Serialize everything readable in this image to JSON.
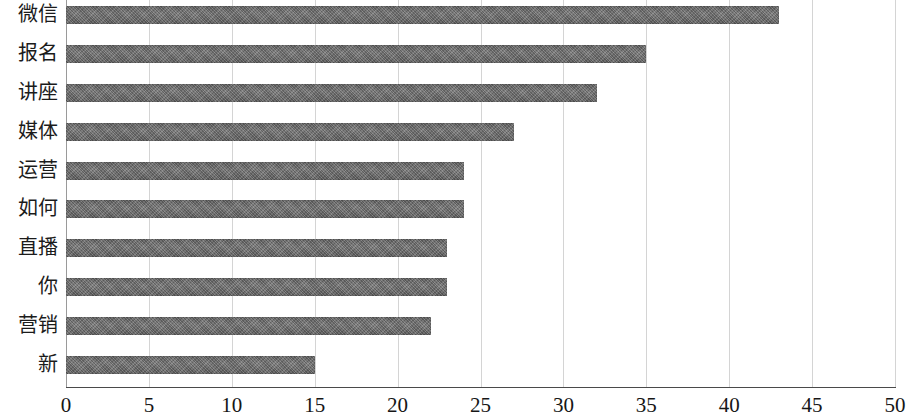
{
  "chart_data": {
    "type": "bar",
    "orientation": "horizontal",
    "title": "",
    "subtitle": "",
    "xlabel": "",
    "ylabel": "",
    "categories": [
      "微信",
      "报名",
      "讲座",
      "媒体",
      "运营",
      "如何",
      "直播",
      "你",
      "营销",
      "新"
    ],
    "values": [
      43,
      35,
      32,
      27,
      24,
      24,
      23,
      23,
      22,
      15
    ],
    "series": [
      {
        "name": "",
        "values": [
          43,
          35,
          32,
          27,
          24,
          24,
          23,
          23,
          22,
          15
        ]
      }
    ],
    "xlim": [
      0,
      50
    ],
    "ylim": null,
    "xticks": [
      0,
      5,
      10,
      15,
      20,
      25,
      30,
      35,
      40,
      45,
      50
    ],
    "xtick_labels": [
      "0",
      "5",
      "10",
      "15",
      "20",
      "25",
      "30",
      "35",
      "40",
      "45",
      "50"
    ],
    "grid": "vertical",
    "legend": null,
    "legend_position": "none",
    "annotations": [],
    "colors": {
      "bar_fill": "#6e6e6e",
      "gridline": "#d4d4d4",
      "axis_line": "#4a4a4a",
      "text": "#161616",
      "background": "#ffffff"
    }
  }
}
